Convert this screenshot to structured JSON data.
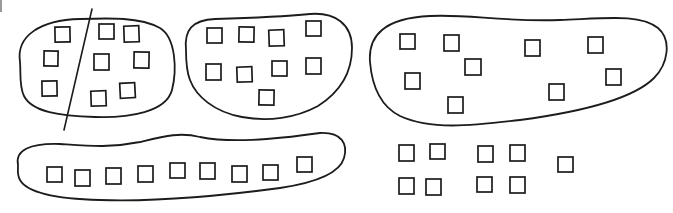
{
  "diagram": {
    "stroke_color": "#1c1c1c",
    "background": "#ffffff",
    "groups": [
      {
        "id": "group-1",
        "label": "Oval group split by a line",
        "item_count": 9,
        "divided": true,
        "items_left_of_line": 3,
        "items_right_of_line": 6
      },
      {
        "id": "group-2",
        "label": "Bean-shaped group",
        "item_count": 9,
        "divided": false
      },
      {
        "id": "group-3",
        "label": "Wide elongated group",
        "item_count": 9,
        "divided": false
      },
      {
        "id": "group-4",
        "label": "Long row group",
        "item_count": 9,
        "divided": false
      }
    ],
    "ungrouped": {
      "label": "Loose items without enclosure",
      "item_count": 9
    }
  }
}
